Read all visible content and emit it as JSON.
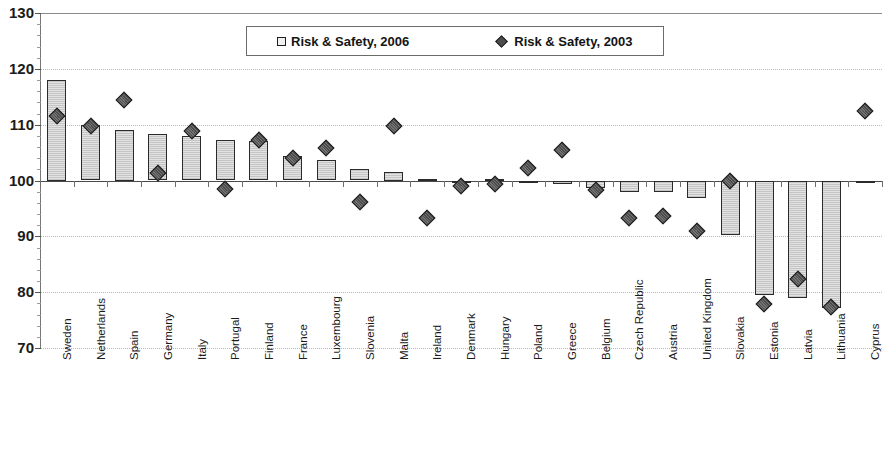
{
  "chart_data": {
    "type": "bar",
    "title": "",
    "subtitle": "",
    "xlabel": "",
    "ylabel": "",
    "ylim": [
      70,
      130
    ],
    "yticks": [
      70,
      80,
      90,
      100,
      110,
      120,
      130
    ],
    "ytick_labels": [
      "70",
      "80",
      "90",
      "100",
      "110",
      "120",
      "130"
    ],
    "grid": true,
    "baseline": 100,
    "legend_position": "top-center",
    "categories": [
      "Sweden",
      "Netherlands",
      "Spain",
      "Germany",
      "Italy",
      "Portugal",
      "Finland",
      "France",
      "Luxembourg",
      "Slovenia",
      "Malta",
      "Ireland",
      "Denmark",
      "Hungary",
      "Poland",
      "Greece",
      "Belgium",
      "Czech Republic",
      "Austria",
      "United Kingdom",
      "Slovakia",
      "Estonia",
      "Latvia",
      "Lithuania",
      "Cyprus"
    ],
    "series": [
      {
        "name": "Risk & Safety, 2006",
        "marker": "square",
        "render": "bar",
        "values": [
          118.0,
          110.0,
          109.0,
          108.3,
          108.0,
          107.2,
          107.0,
          104.3,
          103.7,
          102.0,
          101.5,
          100.3,
          100.0,
          100.2,
          99.5,
          99.3,
          98.6,
          98.0,
          98.0,
          96.8,
          90.3,
          79.5,
          79.0,
          77.2,
          99.6
        ]
      },
      {
        "name": "Risk & Safety, 2003",
        "marker": "diamond",
        "render": "point",
        "values": [
          111.5,
          109.8,
          114.5,
          101.3,
          108.8,
          98.5,
          107.2,
          104.0,
          105.8,
          96.2,
          109.8,
          93.3,
          99.0,
          99.4,
          102.2,
          105.5,
          98.3,
          93.2,
          93.6,
          91.0,
          100.0,
          77.8,
          82.3,
          77.3,
          112.5
        ]
      }
    ],
    "legend": [
      {
        "label": "Risk & Safety, 2006",
        "marker": "square"
      },
      {
        "label": "Risk & Safety, 2003",
        "marker": "diamond"
      }
    ],
    "colors": {
      "bar_fill": "#e2e2e2",
      "bar_border": "#2b2b2b",
      "marker_fill": "#4c4c4c",
      "marker_border": "#1d1d1d",
      "gridline": "#b9b9b9",
      "axis": "#4a4a4a",
      "text": "#1b1b1b"
    }
  }
}
